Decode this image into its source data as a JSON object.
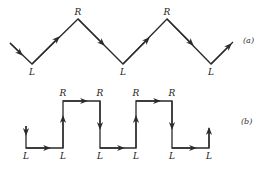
{
  "diagram_a": {
    "tag": "(a)",
    "path": [
      [
        10,
        43
      ],
      [
        32,
        64
      ],
      [
        78,
        19
      ],
      [
        123,
        64
      ],
      [
        167,
        19
      ],
      [
        211,
        64
      ],
      [
        233,
        42
      ]
    ],
    "vertex_labels": [
      {
        "text": "L",
        "x": 32,
        "y": 75
      },
      {
        "text": "R",
        "x": 78,
        "y": 15
      },
      {
        "text": "L",
        "x": 123,
        "y": 75
      },
      {
        "text": "R",
        "x": 167,
        "y": 15
      },
      {
        "text": "L",
        "x": 211,
        "y": 75
      }
    ]
  },
  "diagram_b": {
    "tag": "(b)",
    "path": [
      [
        26,
        126
      ],
      [
        26,
        148
      ],
      [
        63,
        148
      ],
      [
        63,
        101
      ],
      [
        100,
        101
      ],
      [
        100,
        148
      ],
      [
        136,
        148
      ],
      [
        136,
        101
      ],
      [
        172,
        101
      ],
      [
        172,
        148
      ],
      [
        209,
        148
      ],
      [
        209,
        128
      ]
    ],
    "vertex_labels": [
      {
        "text": "L",
        "x": 26,
        "y": 159
      },
      {
        "text": "L",
        "x": 63,
        "y": 159
      },
      {
        "text": "R",
        "x": 63,
        "y": 96
      },
      {
        "text": "R",
        "x": 100,
        "y": 96
      },
      {
        "text": "L",
        "x": 100,
        "y": 159
      },
      {
        "text": "L",
        "x": 136,
        "y": 159
      },
      {
        "text": "R",
        "x": 136,
        "y": 96
      },
      {
        "text": "R",
        "x": 172,
        "y": 96
      },
      {
        "text": "L",
        "x": 172,
        "y": 159
      },
      {
        "text": "L",
        "x": 209,
        "y": 159
      }
    ]
  }
}
